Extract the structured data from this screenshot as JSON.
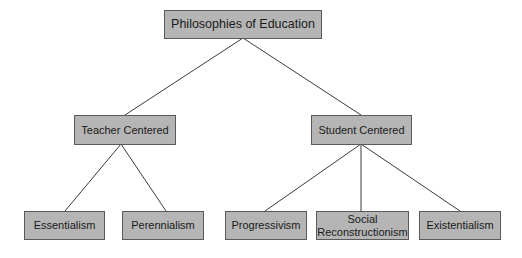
{
  "diagram": {
    "type": "tree",
    "root": {
      "label": "Philosophies of Education",
      "children": [
        {
          "label": "Teacher Centered",
          "children": [
            {
              "label": "Essentialism"
            },
            {
              "label": "Perennialism"
            }
          ]
        },
        {
          "label": "Student Centered",
          "children": [
            {
              "label": "Progressivism"
            },
            {
              "label": "Social Reconstructionism"
            },
            {
              "label": "Existentialism"
            }
          ]
        }
      ]
    },
    "nodes": {
      "root": "Philosophies of Education",
      "teacher": "Teacher Centered",
      "student": "Student Centered",
      "essentialism": "Essentialism",
      "perennialism": "Perennialism",
      "progressivism": "Progressivism",
      "social_line1": "Social",
      "social_line2": "Reconstructionism",
      "existentialism": "Existentialism"
    },
    "colors": {
      "node_fill": "#b5b5b5",
      "node_border": "#5a5a5a",
      "edge": "#3a3a3a",
      "text": "#1a1a1a",
      "background": "#ffffff"
    }
  }
}
